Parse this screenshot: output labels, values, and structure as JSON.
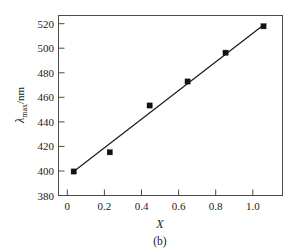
{
  "figure": {
    "caption": "(b)"
  },
  "chart_data": {
    "type": "scatter",
    "title": "",
    "subtitle": "",
    "xlabel": "X",
    "ylabel": "λ",
    "ylabel_sub": "max",
    "ylabel_unit": "/nm",
    "xlim": [
      -0.08,
      1.1
    ],
    "ylim": [
      380,
      530
    ],
    "grid": false,
    "legend": null,
    "xticks": [
      0,
      0.2,
      0.4,
      0.6,
      0.8,
      1.0
    ],
    "xtick_labels": [
      "0",
      "0.2",
      "0.4",
      "0.6",
      "0.8",
      "1.0"
    ],
    "yticks": [
      380,
      400,
      420,
      440,
      460,
      480,
      500,
      520
    ],
    "ytick_labels": [
      "380",
      "400",
      "420",
      "440",
      "460",
      "480",
      "500",
      "520"
    ],
    "x": [
      0.0,
      0.19,
      0.4,
      0.6,
      0.8,
      1.0
    ],
    "values": [
      400,
      416,
      455,
      475,
      499,
      521
    ],
    "series": [
      {
        "name": "data",
        "marker": "square",
        "color": "#111111",
        "x": [
          0.0,
          0.19,
          0.4,
          0.6,
          0.8,
          1.0
        ],
        "values": [
          400,
          416,
          455,
          475,
          499,
          521
        ]
      },
      {
        "name": "linear-fit",
        "marker": "none",
        "color": "#1a1a1a",
        "x": [
          0.0,
          1.0
        ],
        "values": [
          400,
          522
        ]
      }
    ],
    "annotations": []
  }
}
